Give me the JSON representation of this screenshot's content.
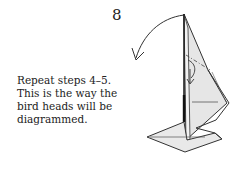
{
  "step": {
    "number": "8",
    "instruction_lines": [
      "Repeat steps 4–5.",
      "This is the way the",
      "bird heads will be",
      "diagrammed."
    ]
  },
  "diagram": {
    "symbols": [
      "turn-over-arrow",
      "valley-fold-arrow",
      "mountain-fold-line",
      "valley-fold-line"
    ],
    "colors": {
      "paper": "#e6e6e6",
      "paper_light": "#f0f0f0",
      "line": "#333333",
      "background": "#ffffff"
    }
  }
}
